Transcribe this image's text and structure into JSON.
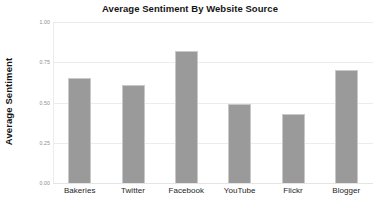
{
  "chart_data": {
    "type": "bar",
    "title": "Average Sentiment By Website Source",
    "xlabel": "",
    "ylabel": "Average Sentiment",
    "categories": [
      "Bakeries",
      "Twitter",
      "Facebook",
      "YouTube",
      "Flickr",
      "Blogger"
    ],
    "values": [
      0.65,
      0.61,
      0.82,
      0.49,
      0.43,
      0.7
    ],
    "series": [
      {
        "name": "Average Sentiment",
        "values": [
          0.65,
          0.61,
          0.82,
          0.49,
          0.43,
          0.7
        ]
      }
    ],
    "ylim": [
      0.0,
      1.0
    ],
    "ytick_labels": [
      "1.00",
      "0.75",
      "0.50",
      "0.25",
      "0.00"
    ],
    "ytick_values": [
      1.0,
      0.75,
      0.5,
      0.25,
      0.0
    ],
    "grid": "horizontal",
    "legend": "none",
    "bar_color": "#9a9a9a",
    "bar_border_color": "#c9c9c9",
    "gridline_color": "#ececed",
    "background_color": "#ffffff",
    "annotations": []
  }
}
